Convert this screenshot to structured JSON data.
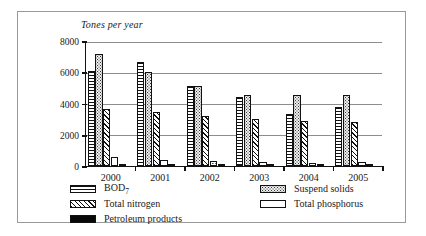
{
  "chart_data": {
    "type": "bar",
    "title": "Tones per year",
    "xlabel": "",
    "ylabel": "Tones per year",
    "ylim": [
      0,
      8000
    ],
    "yticks": [
      0,
      2000,
      4000,
      6000,
      8000
    ],
    "ytick_labels": [
      "0",
      "2000",
      "4000",
      "6000",
      "8000"
    ],
    "grid": true,
    "legend_position": "bottom",
    "categories": [
      "2000",
      "2001",
      "2002",
      "2003",
      "2004",
      "2005"
    ],
    "series": [
      {
        "name": "BOD7",
        "key": "bod",
        "pattern": "horizontal-lines",
        "values": [
          6050,
          6650,
          5100,
          4400,
          3350,
          3750
        ]
      },
      {
        "name": "Suspend solids",
        "key": "ss",
        "pattern": "dotted",
        "values": [
          7150,
          6000,
          5150,
          4550,
          4550,
          4550
        ]
      },
      {
        "name": "Total nitrogen",
        "key": "tn",
        "pattern": "diagonal-hatch",
        "values": [
          3650,
          3450,
          3200,
          3000,
          2850,
          2800
        ]
      },
      {
        "name": "Total phosphorus",
        "key": "tp",
        "pattern": "sparse-dots",
        "values": [
          600,
          400,
          300,
          230,
          220,
          230
        ]
      },
      {
        "name": "Petroleum products",
        "key": "pp",
        "pattern": "solid-black",
        "values": [
          60,
          50,
          45,
          40,
          40,
          40
        ]
      }
    ]
  },
  "legend": {
    "left": [
      {
        "label": "BOD",
        "sub": "7",
        "key": "bod"
      },
      {
        "label": "Total nitrogen",
        "sub": "",
        "key": "tn"
      },
      {
        "label": "Petroleum products",
        "sub": "",
        "key": "pp"
      }
    ],
    "right": [
      {
        "label": "Suspend solids",
        "sub": "",
        "key": "ss"
      },
      {
        "label": "Total phosphorus",
        "sub": "",
        "key": "tp"
      }
    ]
  },
  "colors": {
    "axis": "#111111",
    "grid": "#8d8d8d",
    "frame": "#9a9a9a",
    "text": "#1a1a1a",
    "fill_dark": "#080808",
    "fill_light": "#ededed"
  }
}
